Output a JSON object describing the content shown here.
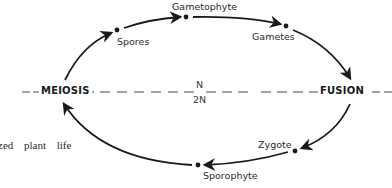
{
  "diagram": {
    "type": "life-cycle",
    "stages": {
      "gametophyte": "Gametophyte",
      "spores": "Spores",
      "gametes": "Gametes",
      "zygote": "Zygote",
      "sporophyte": "Sporophyte"
    },
    "events": {
      "meiosis": "MEIOSIS",
      "fusion": "FUSION"
    },
    "ploidy": {
      "haploid": "N",
      "diploid": "2N"
    },
    "cycle_order": [
      "Sporophyte",
      "MEIOSIS",
      "Spores",
      "Gametophyte",
      "Gametes",
      "FUSION",
      "Zygote",
      "Sporophyte"
    ],
    "divider_style": "dashed"
  },
  "caption": {
    "text": "zed plant life"
  },
  "colors": {
    "line": "#1a1a1a",
    "dash": "#555555",
    "background": "#ffffff"
  }
}
